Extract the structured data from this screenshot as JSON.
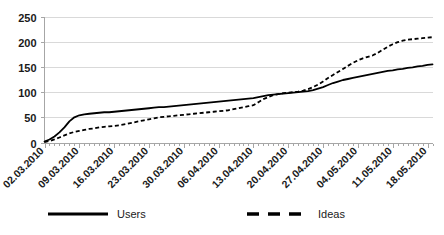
{
  "chart_data": {
    "type": "line",
    "title": "",
    "subtitle": "",
    "xlabel": "",
    "ylabel": "",
    "ylim": [
      0,
      250
    ],
    "ytick_labels": [
      "0",
      "50",
      "100",
      "150",
      "200",
      "250"
    ],
    "ytick_values": [
      0,
      50,
      100,
      150,
      200,
      250
    ],
    "grid": true,
    "legend_position": "bottom",
    "x_tick_labels": [
      "02.03.2010",
      "09.03.2010",
      "16.03.2010",
      "23.03.2010",
      "30.03.2010",
      "06.04.2010",
      "13.04.2010",
      "20.04.2010",
      "27.04.2010",
      "04.05.2010",
      "11.05.2010",
      "18.05.2010"
    ],
    "x_tick_label_rotation": -45,
    "x_minor_ticks_per_interval": 7,
    "x_index_range": [
      0,
      78
    ],
    "series": [
      {
        "name": "Users",
        "style": "solid",
        "color": "#000000",
        "values": [
          2,
          6,
          12,
          20,
          30,
          42,
          50,
          54,
          56,
          57,
          58,
          59,
          60,
          60,
          61,
          62,
          63,
          64,
          65,
          66,
          67,
          68,
          69,
          70,
          70,
          71,
          72,
          73,
          74,
          75,
          76,
          77,
          78,
          79,
          80,
          81,
          82,
          83,
          84,
          85,
          86,
          87,
          88,
          90,
          92,
          94,
          95,
          96,
          97,
          98,
          99,
          100,
          101,
          102,
          104,
          107,
          110,
          114,
          118,
          121,
          124,
          126,
          128,
          130,
          132,
          134,
          136,
          138,
          140,
          142,
          143,
          145,
          146,
          148,
          149,
          151,
          152,
          154,
          155
        ]
      },
      {
        "name": "Ideas",
        "style": "dashed",
        "color": "#000000",
        "values": [
          1,
          3,
          6,
          10,
          14,
          18,
          21,
          23,
          25,
          27,
          28,
          30,
          31,
          32,
          33,
          34,
          36,
          38,
          40,
          42,
          44,
          46,
          48,
          50,
          51,
          52,
          53,
          54,
          55,
          56,
          57,
          58,
          59,
          60,
          61,
          62,
          63,
          64,
          66,
          68,
          70,
          72,
          74,
          80,
          86,
          90,
          94,
          96,
          98,
          99,
          100,
          101,
          103,
          106,
          110,
          115,
          121,
          128,
          134,
          140,
          146,
          152,
          158,
          163,
          167,
          170,
          173,
          178,
          184,
          190,
          195,
          199,
          202,
          204,
          205,
          206,
          207,
          208,
          209
        ]
      }
    ]
  },
  "legend": {
    "entries": [
      {
        "label": "Users",
        "style": "solid"
      },
      {
        "label": "Ideas",
        "style": "dashed"
      }
    ]
  }
}
